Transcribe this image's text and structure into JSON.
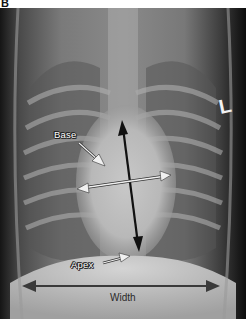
{
  "figure": {
    "panel_label": "B",
    "image_description": "Ventrodorsal thoracic radiograph with cardiac measurement annotations",
    "side_marker": "L",
    "annotations": {
      "base_label": "Base",
      "apex_label": "Apex",
      "width_label": "Width"
    },
    "colors": {
      "long_axis_arrow": "#111111",
      "short_axis_arrow": "#f0f0f0",
      "width_arrow": "#3a3a3a",
      "label_text": "#ffffff"
    }
  }
}
